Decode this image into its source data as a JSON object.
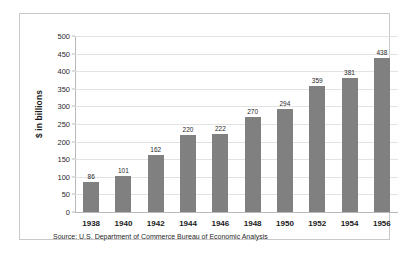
{
  "figure": {
    "y_axis_title": "$ in billions",
    "source_note": "Source: U.S. Department of Commerce Bureau of Economic Analysis",
    "bar_color": "#808080",
    "grid_color": "#e2e2e2",
    "frame_color": "#c9c9c9",
    "background": "#ffffff"
  },
  "chart_data": {
    "type": "bar",
    "title": "",
    "xlabel": "",
    "ylabel": "$ in billions",
    "categories": [
      "1938",
      "1940",
      "1942",
      "1944",
      "1946",
      "1948",
      "1950",
      "1952",
      "1954",
      "1956"
    ],
    "values": [
      86,
      101,
      162,
      220,
      222,
      270,
      294,
      359,
      381,
      438
    ],
    "data_labels": [
      "86",
      "101",
      "162",
      "220",
      "222",
      "270",
      "294",
      "359",
      "381",
      "438"
    ],
    "ylim": [
      0,
      500
    ],
    "ytick_values": [
      0,
      50,
      100,
      150,
      200,
      250,
      300,
      350,
      400,
      450,
      500
    ],
    "ytick_labels": [
      "0",
      "50",
      "100",
      "150",
      "200",
      "250",
      "300",
      "350",
      "400",
      "450",
      "500"
    ],
    "grid": true,
    "grid_axis": "y",
    "legend": false,
    "legend_position": "none",
    "annotations": [
      "Source: U.S. Department of Commerce Bureau of Economic Analysis"
    ]
  }
}
